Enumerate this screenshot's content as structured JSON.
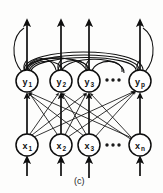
{
  "figure": {
    "caption": "(c)",
    "layers": {
      "output_layer": {
        "name": "y-layer",
        "nodes": [
          {
            "base": "y",
            "sub": "1",
            "cx": 27,
            "cy": 81
          },
          {
            "base": "y",
            "sub": "2",
            "cx": 61,
            "cy": 81
          },
          {
            "base": "y",
            "sub": "3",
            "cx": 89,
            "cy": 81
          },
          {
            "base": "y",
            "sub": "p",
            "cx": 140,
            "cy": 81
          }
        ],
        "ellipsis": {
          "cx": 113,
          "cy": 80,
          "dots": 3
        }
      },
      "input_layer": {
        "name": "x-layer",
        "nodes": [
          {
            "base": "x",
            "sub": "1",
            "cx": 27,
            "cy": 145
          },
          {
            "base": "x",
            "sub": "2",
            "cx": 61,
            "cy": 145
          },
          {
            "base": "x",
            "sub": "3",
            "cx": 89,
            "cy": 145
          },
          {
            "base": "x",
            "sub": "n",
            "cx": 140,
            "cy": 145
          }
        ],
        "ellipsis": {
          "cx": 113,
          "cy": 145,
          "dots": 3
        }
      }
    },
    "node_radius": 11,
    "colors": {
      "ink": "#111111",
      "paper": "#fdfdfc",
      "node_fill": "#ffffff"
    }
  }
}
